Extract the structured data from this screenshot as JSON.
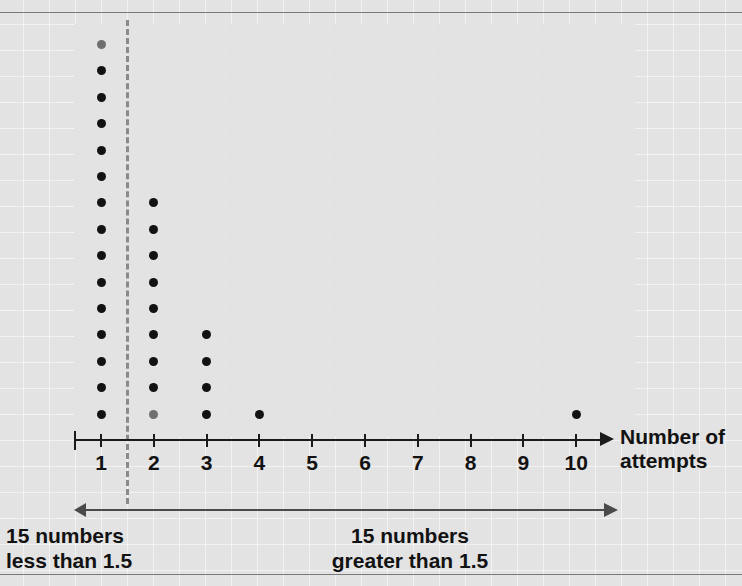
{
  "chart_data": {
    "type": "scatter",
    "plot_style": "dot-plot",
    "title": "",
    "xlabel": "Number of attempts",
    "ylabel": "",
    "categories": [
      1,
      2,
      3,
      4,
      5,
      6,
      7,
      8,
      9,
      10
    ],
    "tick_labels": [
      "1",
      "2",
      "3",
      "4",
      "5",
      "6",
      "7",
      "8",
      "9",
      "10"
    ],
    "values": [
      15,
      9,
      4,
      1,
      0,
      0,
      0,
      0,
      0,
      1
    ],
    "counts_by_value": {
      "1": 15,
      "2": 9,
      "3": 4,
      "4": 1,
      "5": 0,
      "6": 0,
      "7": 0,
      "8": 0,
      "9": 0,
      "10": 1
    },
    "total_points": 30,
    "xlim": [
      0.5,
      10.6
    ],
    "grid": true,
    "legend": null,
    "annotations": [
      {
        "type": "vline",
        "x": 1.5,
        "style": "dashed",
        "label": "1.5"
      },
      {
        "type": "arrow",
        "direction": "left",
        "from_x": 1.5,
        "text": "15 numbers\nless than 1.5"
      },
      {
        "type": "arrow",
        "direction": "right",
        "from_x": 1.5,
        "text": "15 numbers\ngreater than 1.5"
      }
    ]
  },
  "axis": {
    "title_line1": "Number of",
    "title_line2": "attempts",
    "ticks": [
      "1",
      "2",
      "3",
      "4",
      "5",
      "6",
      "7",
      "8",
      "9",
      "10"
    ]
  },
  "notes": {
    "left_line1": "15 numbers",
    "left_line2": "less than 1.5",
    "right_line1": "15 numbers",
    "right_line2": "greater than 1.5"
  },
  "colors": {
    "page_background": "#e3e3e3",
    "dot": "#121212",
    "dot_faded": "#6f6f6f",
    "axis": "#1a1a1a",
    "dashed_line": "#8a8a8a",
    "annotation_arrow": "#4a4a4a",
    "rule": "#7a7a7a"
  }
}
